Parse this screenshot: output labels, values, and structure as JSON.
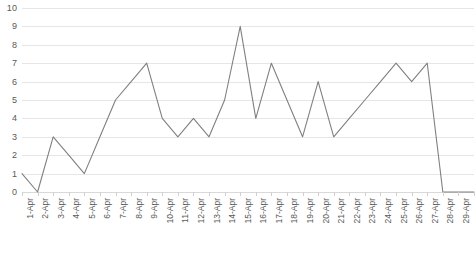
{
  "chart_data": {
    "type": "line",
    "title": "",
    "subtitle": "",
    "xlabel": "",
    "ylabel": "",
    "ylim": [
      0,
      10
    ],
    "ytick_step": 1,
    "yticks": [
      "10",
      "9",
      "8",
      "7",
      "6",
      "5",
      "4",
      "3",
      "2",
      "1",
      "0"
    ],
    "grid": true,
    "legend": "none",
    "line_color": "#808080",
    "gridline_color": "#e6e6e6",
    "label_color": "#595959",
    "categories": [
      "1-Apr",
      "2-Apr",
      "3-Apr",
      "4-Apr",
      "5-Apr",
      "6-Apr",
      "7-Apr",
      "8-Apr",
      "9-Apr",
      "10-Apr",
      "11-Apr",
      "12-Apr",
      "13-Apr",
      "14-Apr",
      "15-Apr",
      "16-Apr",
      "17-Apr",
      "18-Apr",
      "19-Apr",
      "20-Apr",
      "21-Apr",
      "22-Apr",
      "23-Apr",
      "24-Apr",
      "25-Apr",
      "26-Apr",
      "27-Apr",
      "28-Apr",
      "29-Apr",
      "30-Apr"
    ],
    "values": [
      1,
      0,
      3,
      2,
      1,
      3,
      5,
      6,
      7,
      4,
      3,
      4,
      3,
      5,
      9,
      4,
      7,
      5,
      3,
      6,
      3,
      4,
      5,
      6,
      7,
      6,
      7,
      0,
      0,
      0
    ]
  }
}
